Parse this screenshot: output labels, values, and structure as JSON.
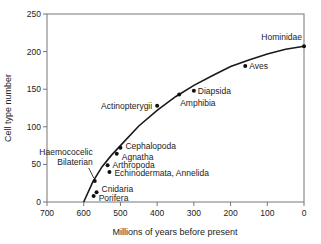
{
  "chart_data": {
    "type": "scatter",
    "title": "",
    "xlabel": "Millions of years before present",
    "ylabel": "Cell type number",
    "xlim": [
      700,
      0
    ],
    "ylim": [
      0,
      250
    ],
    "x_ticks": [
      700,
      600,
      500,
      400,
      300,
      200,
      100,
      0
    ],
    "y_ticks": [
      0,
      50,
      100,
      150,
      200,
      250
    ],
    "grid": false,
    "legend": null,
    "points": [
      {
        "label": "Porifera",
        "x": 573,
        "y": 8
      },
      {
        "label": "Cnidaria",
        "x": 565,
        "y": 13
      },
      {
        "label": "Haemococelic Bilaterian",
        "x": 570,
        "y": 28
      },
      {
        "label": "Echinodermata, Annelida",
        "x": 530,
        "y": 40
      },
      {
        "label": "Arthropoda",
        "x": 535,
        "y": 49
      },
      {
        "label": "Agnatha",
        "x": 510,
        "y": 64
      },
      {
        "label": "Cephalopoda",
        "x": 500,
        "y": 72
      },
      {
        "label": "Actinopterygii",
        "x": 400,
        "y": 128
      },
      {
        "label": "Amphibia",
        "x": 340,
        "y": 143
      },
      {
        "label": "Diapsida",
        "x": 300,
        "y": 148
      },
      {
        "label": "Aves",
        "x": 160,
        "y": 181
      },
      {
        "label": "Hominidae",
        "x": 0,
        "y": 207
      }
    ],
    "fit_curve": {
      "description": "Concave fitted curve from ~600 Mya (0 cell types) rising to ~207 at present",
      "x": [
        600,
        575,
        550,
        525,
        500,
        450,
        400,
        350,
        300,
        250,
        200,
        150,
        100,
        50,
        0
      ],
      "y": [
        0,
        27,
        47,
        62,
        75,
        101,
        122,
        140,
        155,
        168,
        180,
        189,
        197,
        203,
        207
      ]
    }
  }
}
